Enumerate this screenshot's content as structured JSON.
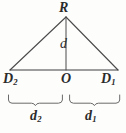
{
  "figure": {
    "kind": "geometry-diagram",
    "ink_color": "#3a3a3a",
    "background_color": "#fdfdfc"
  },
  "labels": {
    "apex": "R",
    "altitude": "d",
    "left_vertex_base": "D",
    "left_vertex_sub": "2",
    "center": "O",
    "right_vertex_base": "D",
    "right_vertex_sub": "1",
    "left_segment_base": "d",
    "left_segment_sub": "2",
    "right_segment_base": "d",
    "right_segment_sub": "1"
  },
  "geometry": {
    "apex_x": 66,
    "apex_y": 17,
    "baseline_y": 70,
    "left_x": 10,
    "right_x": 118,
    "brace_y": 96,
    "brace_left_start": 8,
    "brace_left_end": 63,
    "brace_right_start": 69,
    "brace_right_end": 120
  }
}
